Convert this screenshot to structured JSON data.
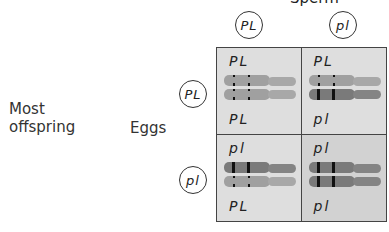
{
  "header": {
    "sperm_label_partial": "Sperm"
  },
  "side_labels": {
    "offspring": "Most\noffspring",
    "eggs": "Eggs"
  },
  "sperm_gametes": [
    "PL",
    "pl"
  ],
  "egg_gametes": [
    "PL",
    "pl"
  ],
  "colors": {
    "dominant_chromosome": "#a0a0a0",
    "recessive_chromosome": "#7a7a7a",
    "band": "#111111",
    "cell_bg": "#dedede",
    "cell_bg_dark": "#d2d2d2"
  },
  "cells": [
    {
      "top_label": "PL",
      "bottom_label": "PL",
      "upper": "dominant",
      "lower": "dominant"
    },
    {
      "top_label": "PL",
      "bottom_label": "pl",
      "upper": "dominant",
      "lower": "recessive"
    },
    {
      "top_label": "pl",
      "bottom_label": "PL",
      "upper": "recessive",
      "lower": "dominant"
    },
    {
      "top_label": "pl",
      "bottom_label": "pl",
      "upper": "recessive",
      "lower": "recessive"
    }
  ]
}
